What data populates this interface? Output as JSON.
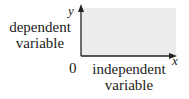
{
  "diagram": {
    "y_axis_variable": "y",
    "x_axis_variable": "x",
    "origin_label": "0",
    "y_axis_label_line1": "dependent",
    "y_axis_label_line2": "variable",
    "x_axis_label_line1": "independent",
    "x_axis_label_line2": "variable",
    "colors": {
      "shaded_region": "#ececec",
      "axis": "#222222"
    }
  }
}
